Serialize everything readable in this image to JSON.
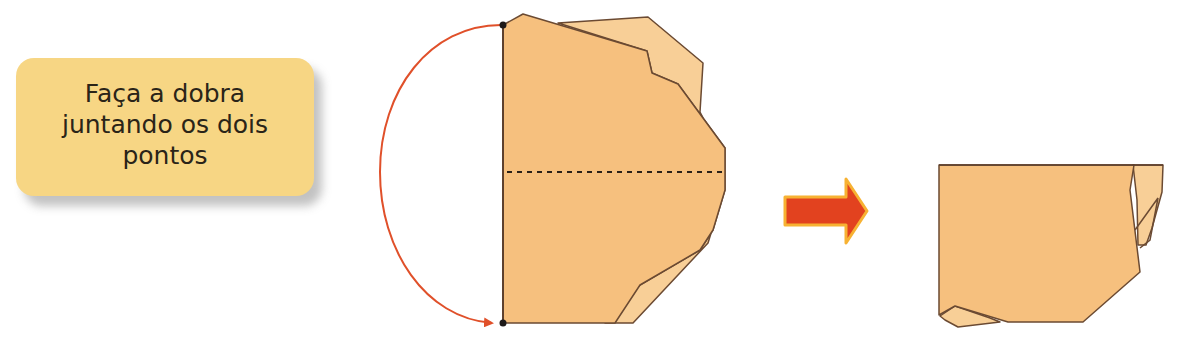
{
  "instruction": {
    "text": "Faça a dobra juntando os dois pontos"
  },
  "colors": {
    "card_background": "#f7d684",
    "paper_front": "#f6c07e",
    "paper_back": "#f8cf97",
    "outline": "#6b4a32",
    "arc_arrow": "#e0502a",
    "step_arrow": "#e2421f",
    "step_arrow_border": "#f7b233"
  },
  "steps": [
    {
      "id": "before-fold",
      "description": "paper with fold points marked and dashed fold line"
    },
    {
      "id": "after-fold",
      "description": "paper folded with points joined"
    }
  ]
}
